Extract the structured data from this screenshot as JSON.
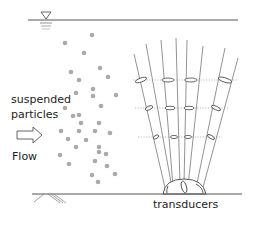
{
  "labels": {
    "particles_line1": "suspended",
    "particles_line2": "particles",
    "flow": "Flow",
    "transducers": "transducers"
  },
  "icons": {
    "water_surface": "inverted-triangle-water-level-icon",
    "flow_arrow": "right-arrow-outline-icon",
    "bed_hatch": "ground-hatch-icon"
  },
  "colors": {
    "line": "#555555",
    "beam": "#777777",
    "particle": "#aaaaaa",
    "dotted": "#999999",
    "text": "#222222"
  },
  "particles": [
    [
      92,
      35
    ],
    [
      65,
      43
    ],
    [
      84,
      53
    ],
    [
      100,
      68
    ],
    [
      71,
      72
    ],
    [
      108,
      77
    ],
    [
      79,
      80
    ],
    [
      93,
      89
    ],
    [
      76,
      93
    ],
    [
      93,
      96
    ],
    [
      116,
      95
    ],
    [
      65,
      108
    ],
    [
      101,
      106
    ],
    [
      79,
      115
    ],
    [
      73,
      116
    ],
    [
      81,
      123
    ],
    [
      99,
      123
    ],
    [
      61,
      131
    ],
    [
      79,
      131
    ],
    [
      95,
      131
    ],
    [
      110,
      133
    ],
    [
      68,
      139
    ],
    [
      86,
      140
    ],
    [
      76,
      147
    ],
    [
      99,
      147
    ],
    [
      99,
      152
    ],
    [
      106,
      154
    ],
    [
      60,
      155
    ],
    [
      69,
      164
    ],
    [
      95,
      161
    ],
    [
      107,
      166
    ],
    [
      92,
      175
    ],
    [
      115,
      174
    ],
    [
      98,
      182
    ]
  ],
  "dotted_levels": [
    80,
    108,
    137
  ]
}
